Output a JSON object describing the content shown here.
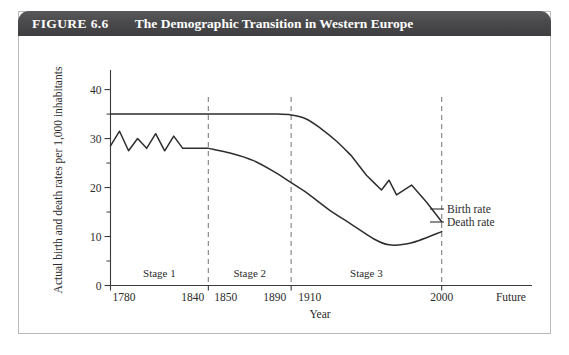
{
  "figure": {
    "number_label": "FIGURE 6.6",
    "title": "The Demographic Transition in Western Europe"
  },
  "chart_data": {
    "type": "line",
    "title": "The Demographic Transition in Western Europe",
    "xlabel": "Year",
    "ylabel": "Actual birth and death rates per 1,000 inhabitants",
    "xlim": [
      1780,
      2060
    ],
    "ylim": [
      0,
      44
    ],
    "grid": false,
    "legend_position": "right-inline",
    "y_ticks_major": [
      0,
      10,
      20,
      30,
      40
    ],
    "y_ticks_minor": [
      5,
      15,
      25,
      35
    ],
    "x_tick_labels": [
      "1780",
      "1840",
      "1850",
      "1890",
      "1910",
      "2000",
      "Future"
    ],
    "x_tick_values": [
      1780,
      1840,
      1850,
      1890,
      1910,
      2000,
      2060
    ],
    "stage_dividers": [
      1845,
      1900,
      2000
    ],
    "stages": [
      {
        "label": "Stage 1",
        "start": 1780,
        "end": 1845
      },
      {
        "label": "Stage 2",
        "start": 1845,
        "end": 1900
      },
      {
        "label": "Stage 3",
        "start": 1900,
        "end": 2000
      }
    ],
    "series": [
      {
        "name": "Birth rate",
        "label": "Birth rate",
        "color": "#2e2e2e",
        "x": [
          1780,
          1800,
          1820,
          1845,
          1870,
          1890,
          1900,
          1910,
          1920,
          1930,
          1940,
          1945,
          1950,
          1955,
          1960,
          1965,
          1970,
          1980,
          1990,
          2000
        ],
        "y": [
          35,
          35,
          35,
          35,
          35,
          35,
          34.8,
          34,
          32,
          29.5,
          26.5,
          24.5,
          22.5,
          21,
          19.5,
          21.5,
          18.5,
          20.5,
          17,
          13
        ]
      },
      {
        "name": "Death rate",
        "label": "Death rate",
        "color": "#2e2e2e",
        "x": [
          1780,
          1786,
          1792,
          1798,
          1804,
          1810,
          1816,
          1822,
          1828,
          1845,
          1860,
          1875,
          1890,
          1900,
          1910,
          1925,
          1940,
          1955,
          1965,
          1975,
          1985,
          2000
        ],
        "y": [
          28.5,
          31.5,
          27.5,
          30,
          28,
          31,
          27.5,
          30.5,
          28,
          28,
          27,
          25.5,
          23,
          21,
          19,
          15.5,
          12.5,
          9.5,
          8.3,
          8.4,
          9.2,
          11
        ]
      }
    ]
  }
}
